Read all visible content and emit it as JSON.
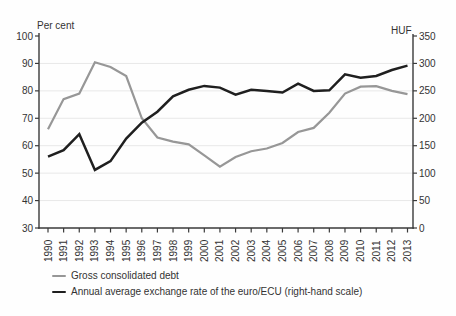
{
  "chart_data": {
    "type": "line",
    "title": "",
    "xlabel": "",
    "x": [
      1990,
      1991,
      1992,
      1993,
      1994,
      1995,
      1996,
      1997,
      1998,
      1999,
      2000,
      2001,
      2002,
      2003,
      2004,
      2005,
      2006,
      2007,
      2008,
      2009,
      2010,
      2011,
      2012,
      2013
    ],
    "series": [
      {
        "name": "Gross consolidated debt",
        "axis": "left",
        "color": "#979797",
        "values": [
          66,
          77,
          79,
          90.4,
          88.7,
          85.4,
          70,
          63,
          61.5,
          60.5,
          56.5,
          52.4,
          55.9,
          58,
          59,
          61,
          65,
          66.5,
          72,
          79,
          81.5,
          81.7,
          80,
          78.8
        ]
      },
      {
        "name": "Annual average exchange rate of the euro/ECU (right-hand scale)",
        "axis": "right",
        "color": "#1f1f1f",
        "values": [
          130,
          142,
          171,
          106,
          122,
          163,
          192,
          212,
          240,
          252,
          259,
          256,
          243,
          252,
          250,
          247,
          263,
          250,
          251,
          280,
          274,
          277,
          288,
          296
        ]
      }
    ],
    "left_axis": {
      "label": "Per cent",
      "min": 30,
      "max": 100,
      "ticks": [
        30,
        40,
        50,
        60,
        70,
        80,
        90,
        100
      ]
    },
    "right_axis": {
      "label": "HUF",
      "min": 0,
      "max": 350,
      "ticks": [
        0,
        50,
        100,
        150,
        200,
        250,
        300,
        350
      ]
    },
    "grid": true,
    "legend_position": "bottom-left",
    "colors": {
      "axis": "#3a3a3a",
      "gridline": "#e8e8e8",
      "text": "#333333",
      "background": "#fefefe"
    }
  }
}
